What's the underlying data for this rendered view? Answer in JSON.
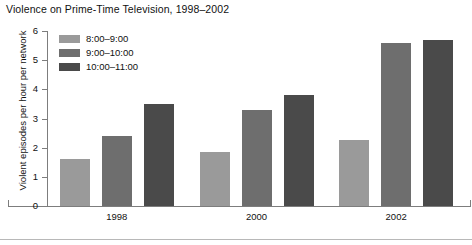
{
  "chart_data": {
    "type": "bar",
    "title": "Violence on Prime-Time Television, 1998–2002",
    "xlabel": "",
    "ylabel": "Violent episodes per hour per network",
    "categories": [
      "1998",
      "2000",
      "2002"
    ],
    "series": [
      {
        "name": "8:00–9:00",
        "values": [
          1.6,
          1.85,
          2.25
        ],
        "color": "#9a9a9a"
      },
      {
        "name": "9:00–10:00",
        "values": [
          2.4,
          3.3,
          5.6
        ],
        "color": "#6e6e6e"
      },
      {
        "name": "10:00–11:00",
        "values": [
          3.5,
          3.8,
          5.7
        ],
        "color": "#4a4a4a"
      }
    ],
    "ylim": [
      0,
      6
    ],
    "yticks": [
      0,
      1,
      2,
      3,
      4,
      5,
      6
    ],
    "ytick_labels": [
      "0",
      "1",
      "2",
      "3",
      "4",
      "5",
      "6"
    ],
    "grid": false,
    "legend_position": "upper-left-inside"
  },
  "axis": {
    "line_color": "#7d7d7d"
  }
}
